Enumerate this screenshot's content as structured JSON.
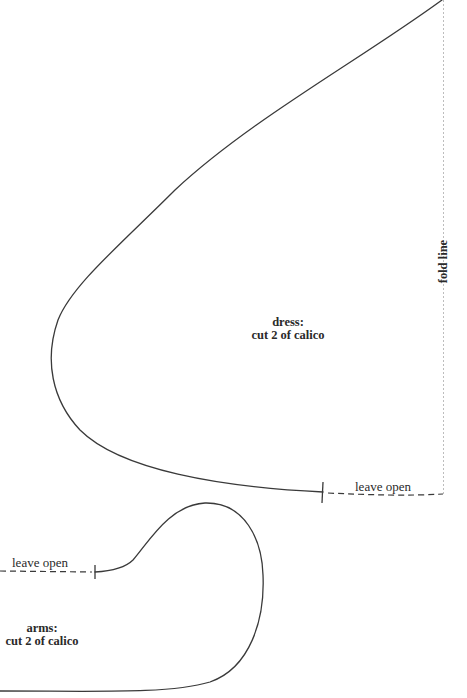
{
  "pattern": {
    "dress": {
      "title": "dress:",
      "instruction": "cut 2 of calico",
      "leave_open_label": "leave open"
    },
    "arms": {
      "title": "arms:",
      "instruction": "cut 2 of calico",
      "leave_open_label": "leave open"
    },
    "fold_line_label": "fold line"
  },
  "colors": {
    "outline": "#3a3a3a",
    "fold_line": "#bdbdbd",
    "background": "#ffffff"
  }
}
